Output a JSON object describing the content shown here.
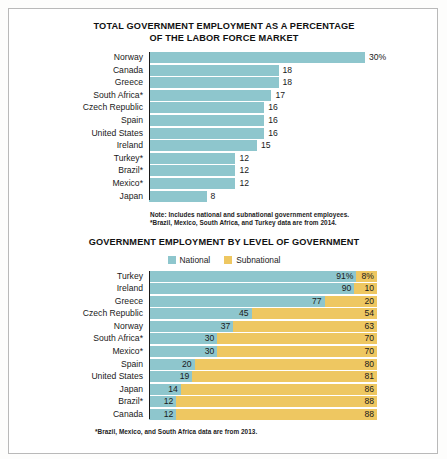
{
  "chart_data": [
    {
      "type": "bar",
      "id": "total-government-employment",
      "title": "TOTAL GOVERNMENT EMPLOYMENT AS A PERCENTAGE OF THE LABOR FORCE MARKET",
      "title_line1": "TOTAL GOVERNMENT EMPLOYMENT AS A PERCENTAGE",
      "title_line2": "OF THE LABOR FORCE MARKET",
      "orientation": "horizontal",
      "xlabel": "",
      "ylabel": "",
      "xlim": [
        0,
        30
      ],
      "grid": false,
      "legend": "none",
      "series_color": "#8ec6cd",
      "categories": [
        "Norway",
        "Canada",
        "Greece",
        "South Africa*",
        "Czech Republic",
        "Spain",
        "United States",
        "Ireland",
        "Turkey*",
        "Brazil*",
        "Mexico*",
        "Japan"
      ],
      "values": [
        30,
        18,
        18,
        17,
        16,
        16,
        16,
        15,
        12,
        12,
        12,
        8
      ],
      "value_labels": [
        "30%",
        "18",
        "18",
        "17",
        "16",
        "16",
        "16",
        "15",
        "12",
        "12",
        "12",
        "8"
      ],
      "notes": [
        "Note: Includes national and subnational government employees.",
        "*Brazil, Mexico, South Africa, and Turkey data are from 2014."
      ]
    },
    {
      "type": "bar",
      "id": "employment-by-level",
      "title": "GOVERNMENT EMPLOYMENT BY LEVEL OF GOVERNMENT",
      "orientation": "horizontal",
      "stacked": true,
      "xlabel": "",
      "ylabel": "",
      "xlim": [
        0,
        100
      ],
      "grid": false,
      "legend_position": "top-center",
      "legend": [
        "National",
        "Subnational"
      ],
      "colors": {
        "National": "#8ec6cd",
        "Subnational": "#eec761"
      },
      "categories": [
        "Turkey",
        "Ireland",
        "Greece",
        "Czech Republic",
        "Norway",
        "South Africa*",
        "Mexico*",
        "Spain",
        "United States",
        "Japan",
        "Brazil*",
        "Canada"
      ],
      "series": [
        {
          "name": "National",
          "values": [
            91,
            90,
            77,
            45,
            37,
            30,
            30,
            20,
            19,
            14,
            12,
            12
          ]
        },
        {
          "name": "Subnational",
          "values": [
            8,
            10,
            20,
            54,
            63,
            70,
            70,
            80,
            81,
            86,
            88,
            88
          ]
        }
      ],
      "national_labels": [
        "91%",
        "90",
        "77",
        "45",
        "37",
        "30",
        "30",
        "20",
        "19",
        "14",
        "12",
        "12"
      ],
      "subnational_labels": [
        "8%",
        "10",
        "20",
        "54",
        "63",
        "70",
        "70",
        "80",
        "81",
        "86",
        "88",
        "88"
      ],
      "notes": [
        "*Brazil, Mexico, and South Africa data are from 2013."
      ]
    }
  ]
}
